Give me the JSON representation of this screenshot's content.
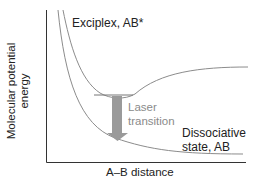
{
  "diagram": {
    "type": "potential-energy-curves",
    "y_axis_label_line1": "Molecular potential",
    "y_axis_label_line2": "energy",
    "x_axis_label": "A–B distance",
    "curves": [
      {
        "name": "Exciplex, AB*",
        "label": "Exciplex, AB*",
        "shape": "bound-well"
      },
      {
        "name": "Dissociative state, AB",
        "label_line1": "Dissociative",
        "label_line2": "state, AB",
        "shape": "repulsive"
      }
    ],
    "transition": {
      "label_line1": "Laser",
      "label_line2": "transition",
      "direction": "down"
    },
    "colors": {
      "axis": "#333333",
      "curve": "#8c8c8c",
      "arrow": "#9a9a9a",
      "transition_text": "#8a8a8a",
      "text": "#222222"
    }
  }
}
